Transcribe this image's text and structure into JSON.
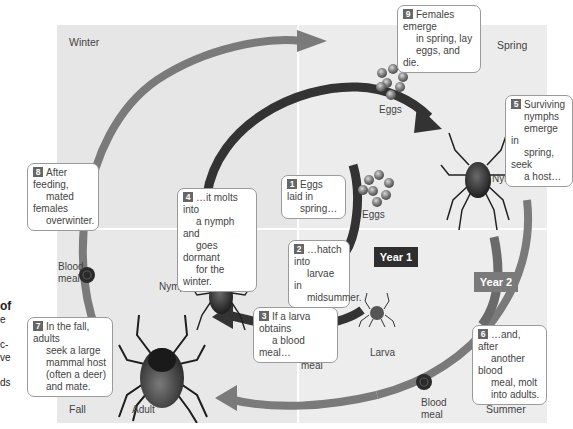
{
  "seasons": {
    "winter": "Winter",
    "spring": "Spring",
    "summer": "Summer",
    "fall": "Fall"
  },
  "year_labels": {
    "year1": "Year 1",
    "year2": "Year 2"
  },
  "colors": {
    "inner_arc": "#333333",
    "outer_arc": "#7a7a7a",
    "year1_box": "#2e2e2e",
    "year2_box": "#7a7a7a",
    "callout_number": "#666666"
  },
  "stage_labels": {
    "eggs_top": "Eggs",
    "eggs_inner": "Eggs",
    "nymph_right": "Nymph",
    "nymph_left": "Nymph",
    "larva": "Larva",
    "adult": "Adult",
    "blood_meal_left_1": "Blood",
    "blood_meal_left_2": "meal",
    "blood_meal_center_1": "Blood",
    "blood_meal_center_2": "meal",
    "blood_meal_right_1": "Blood",
    "blood_meal_right_2": "meal"
  },
  "callouts": [
    {
      "num": "1",
      "lines": [
        "Eggs laid in",
        "spring…"
      ]
    },
    {
      "num": "2",
      "lines": [
        "…hatch into",
        "larvae in",
        "midsummer."
      ]
    },
    {
      "num": "3",
      "lines": [
        "If a larva obtains",
        "a blood meal…"
      ]
    },
    {
      "num": "4",
      "lines": [
        "…it molts into",
        "a nymph and",
        "goes dormant",
        "for the winter."
      ]
    },
    {
      "num": "5",
      "lines": [
        "Surviving",
        "nymphs",
        "emerge in",
        "spring, seek",
        "a host…"
      ]
    },
    {
      "num": "6",
      "lines": [
        "…and, after",
        "another blood",
        "meal, molt",
        "into adults."
      ]
    },
    {
      "num": "7",
      "lines": [
        "In the fall, adults",
        "seek a large",
        "mammal host",
        "(often a deer)",
        "and mate."
      ]
    },
    {
      "num": "8",
      "lines": [
        "After feeding,",
        "mated females",
        "overwinter."
      ]
    },
    {
      "num": "9",
      "lines": [
        "Females emerge",
        "in spring, lay",
        "eggs, and die."
      ]
    }
  ],
  "side_text": {
    "line1": "of",
    "line2": "e",
    "line3": "c-",
    "line4": "ve",
    "line5": "ds"
  }
}
